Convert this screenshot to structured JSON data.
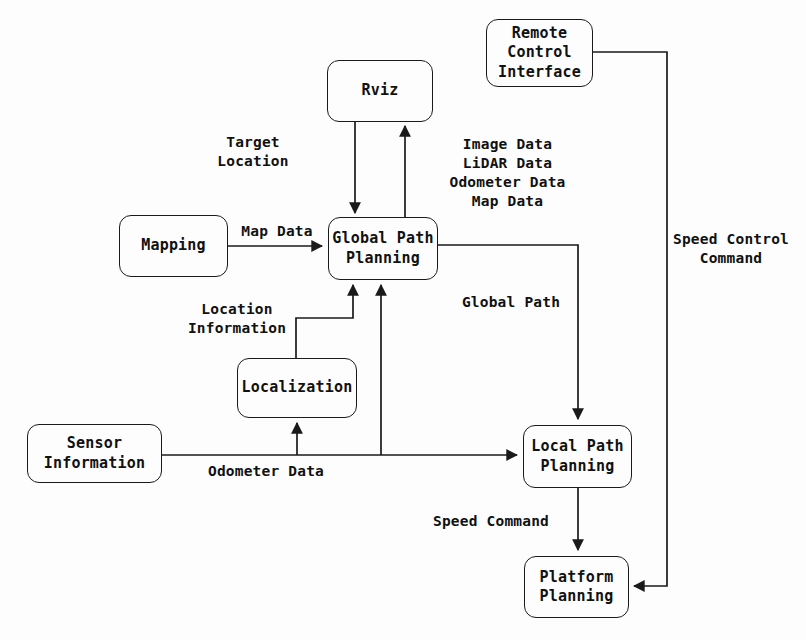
{
  "diagram": {
    "type": "block-flow-diagram",
    "canvas": {
      "width": 806,
      "height": 640
    },
    "style": {
      "background": "#fdfdfd",
      "line_color": "#1a1a1a",
      "text_color": "#111111"
    }
  },
  "nodes": [
    {
      "id": "rviz",
      "label": "Rviz",
      "x": 327,
      "y": 60,
      "w": 106,
      "h": 62
    },
    {
      "id": "remote_control",
      "label": "Remote\nControl\nInterface",
      "x": 486,
      "y": 19,
      "w": 107,
      "h": 68
    },
    {
      "id": "mapping",
      "label": "Mapping",
      "x": 119,
      "y": 215,
      "w": 109,
      "h": 62
    },
    {
      "id": "global_path",
      "label": "Global Path\nPlanning",
      "x": 328,
      "y": 217,
      "w": 110,
      "h": 63
    },
    {
      "id": "localization",
      "label": "Localization",
      "x": 237,
      "y": 358,
      "w": 120,
      "h": 60
    },
    {
      "id": "sensor_info",
      "label": "Sensor\nInformation",
      "x": 27,
      "y": 424,
      "w": 135,
      "h": 59
    },
    {
      "id": "local_path",
      "label": "Local Path\nPlanning",
      "x": 523,
      "y": 425,
      "w": 109,
      "h": 63
    },
    {
      "id": "platform",
      "label": "Platform\nPlanning",
      "x": 524,
      "y": 556,
      "w": 105,
      "h": 62
    }
  ],
  "edge_labels": [
    {
      "id": "target_location",
      "text": "Target\nLocation",
      "x": 188,
      "y": 133,
      "w": 130,
      "align": "center"
    },
    {
      "id": "sensor_streams",
      "text": "Image Data\nLiDAR Data\nOdometer Data\nMap Data",
      "x": 430,
      "y": 135,
      "w": 155,
      "align": "center"
    },
    {
      "id": "map_data",
      "text": "Map Data",
      "x": 232,
      "y": 222,
      "w": 90,
      "align": "center"
    },
    {
      "id": "speed_control_command",
      "text": "Speed Control\nCommand",
      "x": 666,
      "y": 230,
      "w": 130,
      "align": "center"
    },
    {
      "id": "location_information",
      "text": "Location\nInformation",
      "x": 178,
      "y": 300,
      "w": 118,
      "align": "center"
    },
    {
      "id": "global_path_label",
      "text": "Global Path",
      "x": 459,
      "y": 293,
      "w": 104,
      "align": "center"
    },
    {
      "id": "odometer_data",
      "text": "Odometer Data",
      "x": 196,
      "y": 462,
      "w": 140,
      "align": "center"
    },
    {
      "id": "speed_command",
      "text": "Speed Command",
      "x": 416,
      "y": 512,
      "w": 150,
      "align": "center"
    }
  ],
  "connections": [
    {
      "id": "rviz-to-global",
      "from": "rviz",
      "to": "global_path",
      "label": "Target Location"
    },
    {
      "id": "global-to-rviz",
      "from": "global_path",
      "to": "rviz",
      "label": "Image Data / LiDAR Data / Odometer Data / Map Data"
    },
    {
      "id": "mapping-to-global",
      "from": "mapping",
      "to": "global_path",
      "label": "Map Data"
    },
    {
      "id": "localization-to-global",
      "from": "localization",
      "to": "global_path",
      "label": "Location Information"
    },
    {
      "id": "sensor-to-localization",
      "from": "sensor_info",
      "to": "localization",
      "label": "Odometer Data"
    },
    {
      "id": "sensor-to-global",
      "from": "sensor_info",
      "to": "global_path",
      "label": "Odometer Data"
    },
    {
      "id": "sensor-to-local",
      "from": "sensor_info",
      "to": "local_path",
      "label": "Odometer Data"
    },
    {
      "id": "global-to-local",
      "from": "global_path",
      "to": "local_path",
      "label": "Global Path"
    },
    {
      "id": "local-to-platform",
      "from": "local_path",
      "to": "platform",
      "label": "Speed Command"
    },
    {
      "id": "remote-to-platform",
      "from": "remote_control",
      "to": "platform",
      "label": "Speed Control Command"
    }
  ]
}
